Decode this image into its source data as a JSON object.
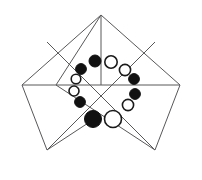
{
  "figure": {
    "canvas": {
      "width": 202,
      "height": 180,
      "background": "#ffffff"
    },
    "style": {
      "outline_color": "#58585a",
      "outline_width": 1,
      "filled_token_color": "#111111",
      "open_token_fill": "#ffffff",
      "open_token_stroke": "#1a1a1a"
    },
    "shapes": [
      {
        "name": "left-square",
        "kind": "polygon",
        "points": "101,15 180,85 101,155 22,85"
      }
    ],
    "squares": [
      {
        "name": "left-rotated-square",
        "points": "101,15 157,72 101,129 45,72"
      },
      {
        "name": "right-rotated-square",
        "points": "101,15 157,72 101,129 45,72"
      }
    ],
    "outline_polygons": [
      {
        "name": "left-kite",
        "points": "101,15 138,75 101,118 47,150 22,85"
      },
      {
        "name": "right-kite",
        "points": "101,15 180,85 155,150 101,118 64,75"
      }
    ],
    "outlines": [
      {
        "name": "left-diamond",
        "points": "101,15 146,85 47,150 22,85"
      },
      {
        "name": "right-diamond",
        "points": "101,15 180,85 155,150 56,85"
      }
    ],
    "diagonals": [
      {
        "name": "diagonal-main",
        "x1": 22,
        "y1": 85,
        "x2": 180,
        "y2": 85
      },
      {
        "name": "diagonal-vertical",
        "x1": 101,
        "y1": 15,
        "x2": 101,
        "y2": 85
      },
      {
        "name": "diagonal-nw-se",
        "x1": 47,
        "y1": 150,
        "x2": 155,
        "y2": 42
      },
      {
        "name": "diagonal-ne-sw",
        "x1": 155,
        "y1": 150,
        "x2": 47,
        "y2": 42
      }
    ],
    "center": {
      "x": 101,
      "y": 85
    },
    "tokens": [
      {
        "name": "token-top-left-inner",
        "cx": 95,
        "cy": 61,
        "r": 6.0,
        "fill": "filled"
      },
      {
        "name": "token-top-right-inner",
        "cx": 111,
        "cy": 62,
        "r": 6.2,
        "fill": "open"
      },
      {
        "name": "token-upper-left",
        "cx": 81,
        "cy": 69,
        "r": 5.4,
        "fill": "filled"
      },
      {
        "name": "token-upper-right",
        "cx": 125,
        "cy": 70,
        "r": 5.6,
        "fill": "open"
      },
      {
        "name": "token-mid-left-upper",
        "cx": 76,
        "cy": 79,
        "r": 4.8,
        "fill": "open"
      },
      {
        "name": "token-mid-right-upper",
        "cx": 134,
        "cy": 79,
        "r": 5.4,
        "fill": "filled"
      },
      {
        "name": "token-mid-left-lower",
        "cx": 74,
        "cy": 91,
        "r": 5.0,
        "fill": "open"
      },
      {
        "name": "token-mid-right-lower",
        "cx": 135,
        "cy": 94,
        "r": 5.4,
        "fill": "filled"
      },
      {
        "name": "token-lower-left",
        "cx": 80,
        "cy": 102,
        "r": 5.4,
        "fill": "filled"
      },
      {
        "name": "token-lower-right",
        "cx": 128,
        "cy": 105,
        "r": 5.6,
        "fill": "open"
      },
      {
        "name": "token-bottom-left",
        "cx": 93,
        "cy": 119,
        "r": 8.5,
        "fill": "filled"
      },
      {
        "name": "token-bottom-right",
        "cx": 113,
        "cy": 119,
        "r": 8.5,
        "fill": "open"
      }
    ],
    "counts": {
      "filled": 6,
      "open": 6,
      "total": 12
    }
  }
}
